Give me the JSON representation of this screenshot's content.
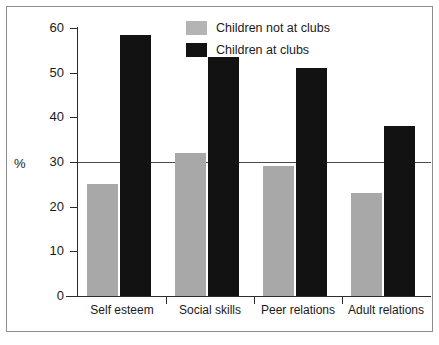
{
  "chart_data": {
    "type": "bar",
    "title": "",
    "xlabel": "",
    "ylabel": "%",
    "ylim": [
      0,
      60
    ],
    "yticks": [
      0,
      10,
      20,
      30,
      40,
      50,
      60
    ],
    "grid": false,
    "legend_position": "top-center",
    "reference_lines": [
      30
    ],
    "categories": [
      "Self esteem",
      "Social skills",
      "Peer relations",
      "Adult relations"
    ],
    "series": [
      {
        "name": "Children not at clubs",
        "color": "#a8a8a8",
        "values": [
          25,
          32,
          29,
          23
        ]
      },
      {
        "name": "Children at clubs",
        "color": "#121212",
        "values": [
          58.5,
          53.5,
          51,
          38
        ]
      }
    ]
  },
  "axis": {
    "y_tick_labels": [
      "60",
      "50",
      "40",
      "30",
      "20",
      "10",
      "0"
    ],
    "percent_symbol": "%"
  },
  "legend": {
    "items": [
      {
        "label": "Children not at clubs",
        "swatch": "gray"
      },
      {
        "label": "Children at clubs",
        "swatch": "black"
      }
    ]
  },
  "colors": {
    "series_gray": "#a8a8a8",
    "series_black": "#121212",
    "axis": "#2b2b2b",
    "frame": "#8d8d8d",
    "background": "#ffffff"
  }
}
